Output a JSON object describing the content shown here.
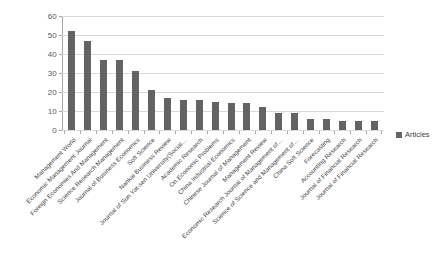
{
  "chart_data": {
    "type": "bar",
    "title": "",
    "xlabel": "",
    "ylabel": "",
    "ylim": [
      0,
      60
    ],
    "yticks": [
      0,
      10,
      20,
      30,
      40,
      50,
      60
    ],
    "grid": true,
    "legend_position": "right",
    "orientation": "vertical",
    "bar_color": "#636363",
    "gridline_color": "#d9d9d9",
    "axis_color": "#a6a6a6",
    "label_rotation": -45,
    "series": [
      {
        "name": "Articles",
        "values": [
          52,
          47,
          37,
          37,
          31,
          21,
          17,
          16,
          16,
          15,
          14,
          14,
          12,
          9,
          9,
          6,
          6,
          5,
          5,
          5
        ]
      }
    ],
    "categories": [
      "Management World",
      "Economic Management Journal",
      "Foreign Economies And Management",
      "Science Research Management",
      "Journal of Business Economics",
      "Soft Science",
      "Nankai Business Review",
      "Journal of Sun Yat-sen University(Social…",
      "Academic Research",
      "On Economic Problems",
      "China Industrial Economics",
      "Chinese Journal of Management",
      "Management Review",
      "Economic Research Journal of Management of…",
      "Science of Science and Management of…",
      "China Soft Science",
      "Forecasting",
      "Accounting Research",
      "Journal of Financial Research",
      "Journal of Financial Research"
    ]
  },
  "legend": {
    "entries": [
      {
        "label": "Articles",
        "color": "#636363"
      }
    ]
  }
}
